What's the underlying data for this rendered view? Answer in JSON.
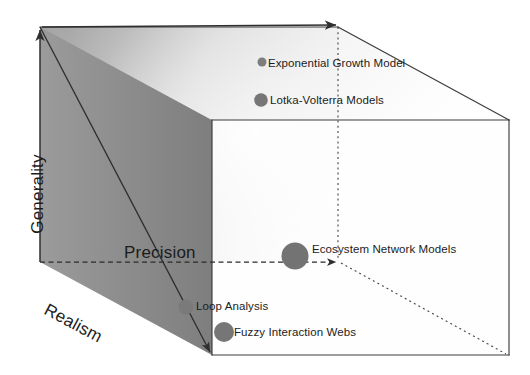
{
  "figure": {
    "type": "conceptual-cube-diagram",
    "background": "#ffffff",
    "axes": [
      {
        "id": "generality",
        "label": "Generality",
        "orientation": "vertical",
        "direction": "up"
      },
      {
        "id": "realism",
        "label": "Realism",
        "orientation": "diagonal",
        "direction": "down-left"
      },
      {
        "id": "precision",
        "label": "Precision",
        "orientation": "horizontal",
        "direction": "right"
      }
    ],
    "cube": {
      "back_face": {
        "x1": 40,
        "y1": 27,
        "x2": 338,
        "y2": 262
      },
      "depth_offset": {
        "dx": 172,
        "dy": 93
      },
      "front_face": {
        "x1": 212,
        "y1": 120,
        "x2": 509,
        "y2": 355
      },
      "stroke": "#3a3a3a",
      "gradient_dark": "#878787",
      "gradient_light": "#fbfbfb"
    },
    "markers": [
      {
        "id": "exponential-growth-model",
        "label": "Exponential Growth Model",
        "cx": 262,
        "cy": 62,
        "r": 4.5,
        "color": "#7d7d7d"
      },
      {
        "id": "lotka-volterra-models",
        "label": "Lotka-Volterra Models",
        "cx": 261,
        "cy": 100,
        "r": 6.8,
        "color": "#767676"
      },
      {
        "id": "ecosystem-network-models",
        "label": "Ecosystem Network Models",
        "cx": 295,
        "cy": 256,
        "r": 13.5,
        "color": "#737373"
      },
      {
        "id": "loop-analysis",
        "label": "Loop Analysis",
        "cx": 186,
        "cy": 307,
        "r": 7.5,
        "color": "#7a7a7a"
      },
      {
        "id": "fuzzy-interaction-webs",
        "label": "Fuzzy Interaction Webs",
        "cx": 224,
        "cy": 332,
        "r": 10,
        "color": "#767676"
      }
    ]
  }
}
